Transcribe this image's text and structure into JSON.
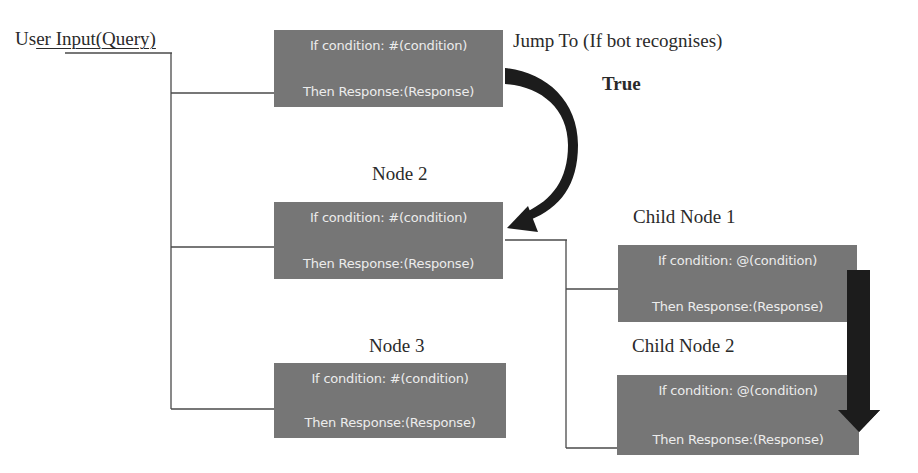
{
  "diagram": {
    "root_label": {
      "prefix": "Us",
      "underlined": "er Input(Query)"
    },
    "jump_label": "Jump To (If bot recognises)",
    "true_label": "True",
    "nodes": [
      {
        "title": "",
        "condition": "If condition: #(condition)",
        "response": "Then Response:(Response)"
      },
      {
        "title": "Node 2",
        "condition": "If condition: #(condition)",
        "response": "Then Response:(Response)"
      },
      {
        "title": "Node 3",
        "condition": "If condition: #(condition)",
        "response": "Then Response:(Response)"
      }
    ],
    "child_nodes": [
      {
        "title": "Child Node 1",
        "condition": "If condition: @(condition)",
        "response": "Then Response:(Response)"
      },
      {
        "title": "Child Node 2",
        "condition": "If condition: @(condition)",
        "response": "Then Response:(Response)"
      }
    ],
    "colors": {
      "box_fill": "#767676",
      "box_text": "#ececec",
      "line": "#4a4a4a",
      "arrow": "#1c1c1c",
      "background": "#ffffff"
    }
  }
}
